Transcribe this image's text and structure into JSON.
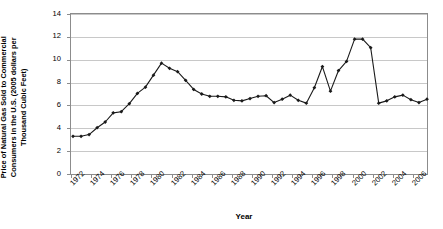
{
  "chart_data": {
    "type": "line",
    "title": "",
    "xlabel": "Year",
    "ylabel": "Price of Natural Gas Sold to Commercial Consumers in the U.S. (2005 dollars per Thousand Cubic Feet)",
    "ylim": [
      0,
      14
    ],
    "xlim": [
      1972,
      2007.5
    ],
    "ytick_labels": [
      "0",
      "2",
      "4",
      "6",
      "8",
      "10",
      "12",
      "14"
    ],
    "ytick_values": [
      0,
      2,
      4,
      6,
      8,
      10,
      12,
      14
    ],
    "xtick_labels": [
      "1972",
      "1974",
      "1976",
      "1978",
      "1980",
      "1982",
      "1984",
      "1986",
      "1988",
      "1990",
      "1992",
      "1994",
      "1996",
      "1998",
      "2000",
      "2002",
      "2004",
      "2006"
    ],
    "xtick_values": [
      1972,
      1974,
      1976,
      1978,
      1980,
      1982,
      1984,
      1986,
      1988,
      1990,
      1992,
      1994,
      1996,
      1998,
      2000,
      2002,
      2004,
      2006
    ],
    "grid": "horizontal",
    "legend": "none",
    "marker": "filled-diamond",
    "line_color": "#1a1a1a",
    "marker_color": "#1a1a1a",
    "grid_color": "#c8c8c8",
    "axis_color": "#808080",
    "series": [
      {
        "name": "Price of Natural Gas Sold to Commercial Consumers",
        "x": [
          1972.2,
          1973.0,
          1973.8,
          1974.6,
          1975.4,
          1976.2,
          1977.0,
          1977.8,
          1978.6,
          1979.4,
          1980.2,
          1981.0,
          1981.8,
          1982.6,
          1983.4,
          1984.2,
          1985.0,
          1985.8,
          1986.6,
          1987.4,
          1988.2,
          1989.0,
          1989.8,
          1990.6,
          1991.4,
          1992.2,
          1993.0,
          1993.8,
          1994.6,
          1995.4,
          1996.2,
          1997.0,
          1997.8,
          1998.6,
          1999.4,
          2000.2,
          2001.0,
          2001.8,
          2002.6,
          2003.4,
          2004.2,
          2005.0,
          2005.8,
          2006.6,
          2007.4
        ],
        "y": [
          3.3,
          3.3,
          3.45,
          4.05,
          4.55,
          5.35,
          5.45,
          6.15,
          7.05,
          7.6,
          8.65,
          9.7,
          9.25,
          8.95,
          8.2,
          7.4,
          7.0,
          6.8,
          6.8,
          6.75,
          6.45,
          6.4,
          6.6,
          6.8,
          6.85,
          6.25,
          6.55,
          6.9,
          6.45,
          6.2,
          7.55,
          9.4,
          7.25,
          9.05,
          9.85,
          11.8,
          11.8,
          11.05,
          6.2,
          6.4,
          6.75,
          6.9,
          6.5,
          6.25,
          6.55
        ]
      }
    ],
    "data_points": [
      {
        "x": 1972.2,
        "y": 3.3
      },
      {
        "x": 1973.0,
        "y": 3.3
      },
      {
        "x": 1973.8,
        "y": 3.45
      },
      {
        "x": 1974.6,
        "y": 4.05
      },
      {
        "x": 1975.4,
        "y": 4.55
      },
      {
        "x": 1976.2,
        "y": 5.35
      },
      {
        "x": 1977.0,
        "y": 5.45
      },
      {
        "x": 1977.8,
        "y": 6.15
      },
      {
        "x": 1978.6,
        "y": 7.05
      },
      {
        "x": 1979.4,
        "y": 7.6
      },
      {
        "x": 1980.2,
        "y": 8.65
      },
      {
        "x": 1981.0,
        "y": 9.7
      },
      {
        "x": 1981.8,
        "y": 9.25
      },
      {
        "x": 1982.6,
        "y": 8.95
      },
      {
        "x": 1983.4,
        "y": 8.2
      },
      {
        "x": 1984.2,
        "y": 7.4
      },
      {
        "x": 1985.0,
        "y": 7.0
      },
      {
        "x": 1985.8,
        "y": 6.8
      },
      {
        "x": 1986.6,
        "y": 6.8
      },
      {
        "x": 1987.4,
        "y": 6.75
      },
      {
        "x": 1988.2,
        "y": 6.45
      },
      {
        "x": 1989.0,
        "y": 6.4
      },
      {
        "x": 1989.8,
        "y": 6.6
      },
      {
        "x": 1990.6,
        "y": 6.8
      },
      {
        "x": 1991.4,
        "y": 6.85
      },
      {
        "x": 1992.2,
        "y": 6.25
      },
      {
        "x": 1993.0,
        "y": 6.55
      },
      {
        "x": 1993.8,
        "y": 6.9
      },
      {
        "x": 1994.6,
        "y": 6.45
      },
      {
        "x": 1995.4,
        "y": 6.2
      },
      {
        "x": 1996.2,
        "y": 7.55
      },
      {
        "x": 1997.0,
        "y": 9.4
      },
      {
        "x": 1997.8,
        "y": 7.25
      },
      {
        "x": 1998.6,
        "y": 9.05
      },
      {
        "x": 1999.4,
        "y": 9.85
      },
      {
        "x": 2000.2,
        "y": 11.8
      },
      {
        "x": 2001.0,
        "y": 11.8
      },
      {
        "x": 2001.8,
        "y": 11.05
      }
    ]
  },
  "axes": {
    "y_axis_title": "Price of Natural Gas Sold to Commercial Consumers in the U.S. (2005 dollars per Thousand Cubic Feet)",
    "x_axis_title": "Year"
  }
}
